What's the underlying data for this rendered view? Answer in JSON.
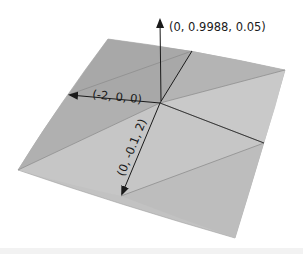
{
  "diagram": {
    "type": "3d-surface-with-vectors",
    "colors": {
      "surface_light": "#c4c4c4",
      "surface_mid": "#b3b3b3",
      "surface_dark": "#a2a2a2",
      "edge": "#8e8e8e",
      "vector": "#1a1a1a",
      "background": "#ffffff"
    },
    "vectors": [
      {
        "id": "normal",
        "label": "(0, 0.9988, 0.05)",
        "direction": "up"
      },
      {
        "id": "tangent-x",
        "label": "(-2, 0, 0)",
        "direction": "left"
      },
      {
        "id": "tangent-z",
        "label": "(0, -0.1, 2)",
        "direction": "down-left"
      }
    ]
  }
}
